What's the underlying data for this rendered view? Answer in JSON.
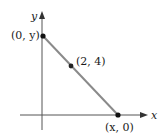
{
  "diagram": {
    "axes": {
      "x_label": "x",
      "y_label": "y",
      "axis_color": "#555555"
    },
    "line": {
      "color": "#888888"
    },
    "points": [
      {
        "label": "(0, y)",
        "px": 43,
        "py": 36
      },
      {
        "label": "(2, 4)",
        "px": 71,
        "py": 66
      },
      {
        "label": "(x, 0)",
        "px": 118,
        "py": 115
      }
    ]
  }
}
